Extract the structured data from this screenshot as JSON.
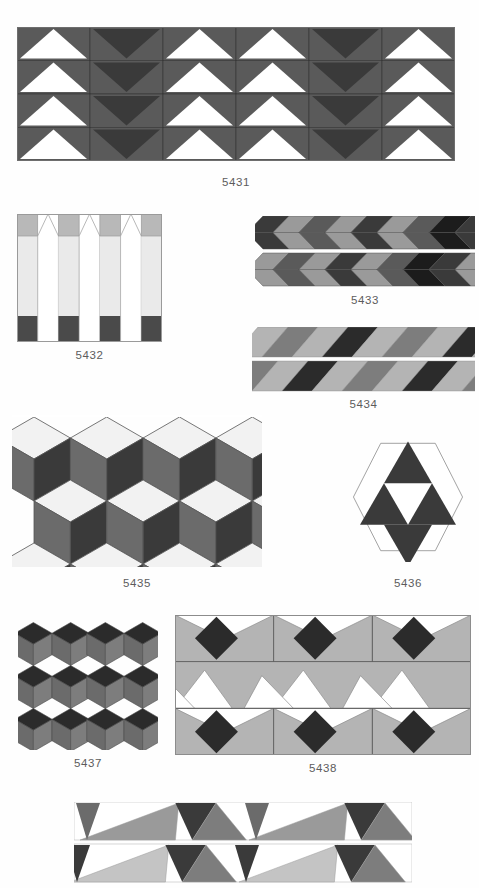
{
  "page": {
    "background_color": "#fefefe",
    "top_cut_text": "",
    "caption_color": "#5c5c5c"
  },
  "palette": {
    "white": "#ffffff",
    "near_white": "#f2f2f2",
    "light_gray": "#c9c9c9",
    "light_gray_2": "#b4b4b4",
    "mid_gray": "#9a9a9a",
    "mid_gray_2": "#7d7d7d",
    "gray": "#6b6b6b",
    "dark_gray": "#5a5a5a",
    "darker_gray": "#4a4a4a",
    "very_dark": "#3a3a3a",
    "near_black": "#2b2b2b",
    "outline": "#6e6e6e",
    "thin_outline": "#8c8c8c"
  },
  "figures": [
    {
      "id": "5431",
      "caption": "5431",
      "type": "triangle-grid",
      "description": "4 rows x 6 columns of square cells; each cell is mid-gray with either a white up-triangle or a dark down-triangle",
      "rows": 4,
      "cols": 6,
      "cell_w": 73,
      "cell_h": 33,
      "column_kinds": [
        "up-white",
        "down-dark",
        "up-white",
        "up-white",
        "down-dark",
        "up-white"
      ],
      "bg_color": "#5a5a5a",
      "triangle_white": "#ffffff",
      "triangle_dark": "#3a3a3a",
      "box": {
        "x": 17,
        "y": 27,
        "w": 438,
        "h": 134
      }
    },
    {
      "id": "5432",
      "caption": "5432",
      "type": "vertical-strips",
      "description": "7 vertical strips; light-gray columns with mid-gray top block and dark-gray bottom block alternating with white arrow/tent columns",
      "strips": 7,
      "column_light": "#eaeaea",
      "column_top": "#b8b8b8",
      "column_bottom": "#4a4a4a",
      "arrow_color": "#ffffff",
      "box": {
        "x": 17,
        "y": 214,
        "w": 145,
        "h": 128
      }
    },
    {
      "id": "5433",
      "caption": "5433",
      "type": "chevron-bands",
      "description": "two horizontal bands of slanted chevron parallelograms alternating mid-gray, dark-gray and near-black",
      "bands": 2,
      "band_colors": [
        "#9a9a9a",
        "#5a5a5a",
        "#3a3a3a",
        "#1c1c1c"
      ],
      "box": {
        "x": 255,
        "y": 216,
        "w": 220,
        "h": 74
      }
    },
    {
      "id": "5434",
      "caption": "5434",
      "type": "diagonal-stripes",
      "description": "two rows of slanted parallelograms in light, mid, dark and near-black gray",
      "rows": 2,
      "stripe_colors": [
        "#b4b4b4",
        "#7d7d7d",
        "#2b2b2b",
        "#9a9a9a"
      ],
      "box": {
        "x": 252,
        "y": 327,
        "w": 223,
        "h": 66
      }
    },
    {
      "id": "5435",
      "caption": "5435",
      "type": "rhombille-cubes",
      "description": "isometric cube (rhombille) tiling, each cube made of white top, mid-gray left and dark-gray right rhombi",
      "face_top": "#f2f2f2",
      "face_left": "#6b6b6b",
      "face_right": "#3a3a3a",
      "box": {
        "x": 12,
        "y": 415,
        "w": 250,
        "h": 152
      }
    },
    {
      "id": "5436",
      "caption": "5436",
      "type": "hexagon-triangles",
      "description": "a white hexagon containing four dark triangles arranged as a Sierpinski first iteration",
      "triangle_color": "#3a3a3a",
      "hex_fill": "#ffffff",
      "hex_stroke": "#8c8c8c",
      "box": {
        "x": 352,
        "y": 432,
        "w": 112,
        "h": 130
      }
    },
    {
      "id": "5437",
      "caption": "5437",
      "type": "hex-rhombi-grid",
      "description": "two columns by three rows of hexagons, each built from a dark central rhombus flanked by two mid-gray rhombi",
      "rows": 3,
      "cols": 2,
      "rhomb_center": "#2b2b2b",
      "rhomb_side_left": "#6b6b6b",
      "rhomb_side_right": "#7d7d7d",
      "box": {
        "x": 18,
        "y": 622,
        "w": 140,
        "h": 128
      }
    },
    {
      "id": "5438",
      "caption": "5438",
      "type": "diamond-bands",
      "description": "three bands; outer bands show dark diamonds on light-gray with white corner triangles, middle band shows a white and light-gray zigzag",
      "bands": 3,
      "diamond_color": "#2b2b2b",
      "band_light": "#b4b4b4",
      "band_white": "#ffffff",
      "box": {
        "x": 175,
        "y": 615,
        "w": 296,
        "h": 140
      }
    },
    {
      "id": "5439",
      "caption": "",
      "type": "triangle-strips",
      "description": "two horizontal strips of long slanted triangles in white, light-gray, mid-gray and dark-gray; cropped by the page edge",
      "rows": 2,
      "colors": [
        "#ffffff",
        "#b4b4b4",
        "#8a8a8a",
        "#6b6b6b",
        "#3a3a3a"
      ],
      "box": {
        "x": 74,
        "y": 802,
        "w": 338,
        "h": 84
      }
    }
  ],
  "captions": [
    {
      "id": "caption-5431",
      "text": "5431",
      "x": 17,
      "y": 176,
      "w": 438
    },
    {
      "id": "caption-5432",
      "text": "5432",
      "x": 17,
      "y": 349,
      "w": 145
    },
    {
      "id": "caption-5433",
      "text": "5433",
      "x": 255,
      "y": 294,
      "w": 220
    },
    {
      "id": "caption-5434",
      "text": "5434",
      "x": 252,
      "y": 398,
      "w": 223
    },
    {
      "id": "caption-5435",
      "text": "5435",
      "x": 12,
      "y": 577,
      "w": 250
    },
    {
      "id": "caption-5436",
      "text": "5436",
      "x": 352,
      "y": 577,
      "w": 112
    },
    {
      "id": "caption-5437",
      "text": "5437",
      "x": 18,
      "y": 757,
      "w": 140
    },
    {
      "id": "caption-5438",
      "text": "5438",
      "x": 175,
      "y": 762,
      "w": 296
    }
  ]
}
